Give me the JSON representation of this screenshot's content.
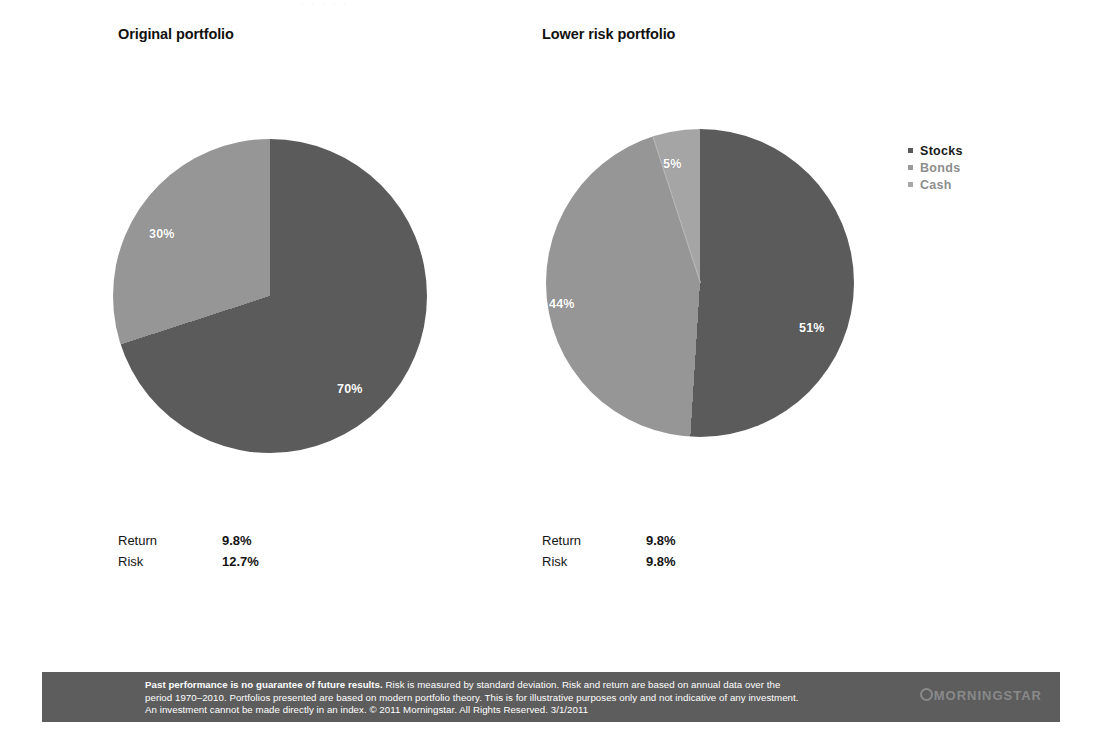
{
  "top_partial_text": "· · ·   · ·",
  "panels": [
    {
      "title": "Original portfolio",
      "stats": [
        {
          "label": "Return",
          "value": "9.8%"
        },
        {
          "label": "Risk",
          "value": "12.7%"
        }
      ]
    },
    {
      "title": "Lower risk portfolio",
      "stats": [
        {
          "label": "Return",
          "value": "9.8%"
        },
        {
          "label": "Risk",
          "value": "9.8%"
        }
      ]
    }
  ],
  "legend": {
    "items": [
      {
        "label": "Stocks",
        "color": "#5a5a5a",
        "text_color": "#1a1a1a"
      },
      {
        "label": "Bonds",
        "color": "#9a9a9a",
        "text_color": "#8e8e8e"
      },
      {
        "label": "Cash",
        "color": "#a8a8a8",
        "text_color": "#8e8e8e"
      }
    ]
  },
  "colors": {
    "stocks": "#5b5b5b",
    "bonds": "#969696",
    "cash": "#a5a5a5",
    "footer_bg": "#5d5d5d",
    "label_text": "#ffffff",
    "title_text": "#111111"
  },
  "footer": {
    "bold_lead": "Past performance is no guarantee of future results.",
    "line1_rest": " Risk is measured by standard deviation. Risk and return are based on annual data over the",
    "line2": "period 1970–2010. Portfolios presented are based on modern portfolio theory. This is for illustrative purposes only and not indicative of any investment.",
    "line3": "An investment cannot be made directly in an index. © 2011 Morningstar. All Rights Reserved. 3/1/2011",
    "logo_text": "MORNINGSTAR"
  },
  "chart_data": [
    {
      "type": "pie",
      "title": "Original portfolio",
      "categories": [
        "Stocks",
        "Bonds",
        "Cash"
      ],
      "values": [
        70,
        30,
        0
      ],
      "labels": [
        "70%",
        "30%",
        ""
      ],
      "colors": [
        "#5b5b5b",
        "#969696",
        "#a5a5a5"
      ],
      "unit": "%",
      "start_angle_deg": 0,
      "direction": "clockwise",
      "legend_position": "right",
      "annotations": [
        {
          "name": "Return",
          "value": "9.8%"
        },
        {
          "name": "Risk",
          "value": "12.7%"
        }
      ]
    },
    {
      "type": "pie",
      "title": "Lower risk portfolio",
      "categories": [
        "Stocks",
        "Bonds",
        "Cash"
      ],
      "values": [
        51,
        44,
        5
      ],
      "labels": [
        "51%",
        "44%",
        "5%"
      ],
      "colors": [
        "#5b5b5b",
        "#969696",
        "#a5a5a5"
      ],
      "unit": "%",
      "start_angle_deg": 0,
      "direction": "clockwise",
      "legend_position": "right",
      "annotations": [
        {
          "name": "Return",
          "value": "9.8%"
        },
        {
          "name": "Risk",
          "value": "9.8%"
        }
      ]
    }
  ]
}
